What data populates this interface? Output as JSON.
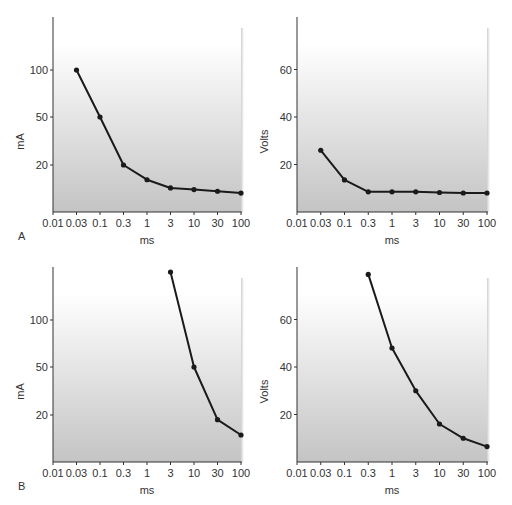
{
  "figure": {
    "panels_row_labels": [
      "A",
      "B"
    ],
    "colors": {
      "line": "#1a1a1a",
      "axis": "#333333",
      "plot_bg_top": "#ffffff",
      "plot_bg_bottom": "#c8c8c8",
      "shadow": "#d6d6d6"
    }
  },
  "chart_data": [
    {
      "id": "A-left",
      "type": "line",
      "row_label": "A",
      "title": "",
      "xlabel": "ms",
      "ylabel": "mA",
      "x_ticks": [
        "0.01",
        "0.03",
        "0.1",
        "0.3",
        "1",
        "3",
        "10",
        "30",
        "100"
      ],
      "y_ticks": [
        "20",
        "50",
        "100"
      ],
      "x_scale": "log",
      "y_scale": "log",
      "grid": false,
      "series": [
        {
          "name": "current threshold",
          "x": [
            0.03,
            0.1,
            0.3,
            1,
            3,
            10,
            30,
            100
          ],
          "y": [
            100,
            50,
            20,
            12,
            9,
            8.5,
            8,
            7.5
          ]
        }
      ]
    },
    {
      "id": "A-right",
      "type": "line",
      "row_label": "A",
      "title": "",
      "xlabel": "ms",
      "ylabel": "Volts",
      "x_ticks": [
        "0.01",
        "0.03",
        "0.1",
        "0.3",
        "1",
        "3",
        "10",
        "30",
        "100"
      ],
      "y_ticks": [
        "20",
        "40",
        "60"
      ],
      "x_scale": "log",
      "y_scale": "linear",
      "ylim": [
        0,
        80
      ],
      "grid": false,
      "series": [
        {
          "name": "voltage threshold",
          "x": [
            0.03,
            0.1,
            0.3,
            1,
            3,
            10,
            30,
            100
          ],
          "y": [
            26,
            13.5,
            8.5,
            8.5,
            8.5,
            8.2,
            8,
            8
          ]
        }
      ]
    },
    {
      "id": "B-left",
      "type": "line",
      "row_label": "B",
      "title": "",
      "xlabel": "ms",
      "ylabel": "mA",
      "x_ticks": [
        "0.01",
        "0.03",
        "0.1",
        "0.3",
        "1",
        "3",
        "10",
        "30",
        "100"
      ],
      "y_ticks": [
        "20",
        "50",
        "100"
      ],
      "x_scale": "log",
      "y_scale": "log",
      "grid": false,
      "series": [
        {
          "name": "current threshold",
          "x": [
            3,
            10,
            30,
            100
          ],
          "y": [
            200,
            50,
            17,
            10
          ]
        }
      ]
    },
    {
      "id": "B-right",
      "type": "line",
      "row_label": "B",
      "title": "",
      "xlabel": "ms",
      "ylabel": "Volts",
      "x_ticks": [
        "0.01",
        "0.03",
        "0.1",
        "0.3",
        "1",
        "3",
        "10",
        "30",
        "100"
      ],
      "y_ticks": [
        "20",
        "40",
        "60"
      ],
      "x_scale": "log",
      "y_scale": "linear",
      "ylim": [
        0,
        80
      ],
      "grid": false,
      "series": [
        {
          "name": "voltage threshold",
          "x": [
            0.3,
            1,
            3,
            10,
            30,
            100
          ],
          "y": [
            79,
            48,
            30,
            16,
            10,
            6.5
          ]
        }
      ]
    }
  ]
}
